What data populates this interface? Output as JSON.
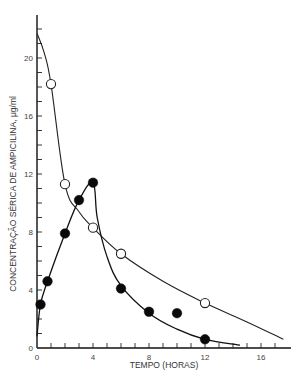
{
  "chart_data": {
    "type": "line",
    "title": "",
    "xlabel": "TEMPO (HORAS)",
    "ylabel": "CONCENTRAÇÃO SÉRICA DE AMPICILINA, μg/ml",
    "xlim": [
      0,
      18.5
    ],
    "ylim": [
      0,
      23
    ],
    "x_ticks": [
      0,
      4,
      8,
      12,
      16
    ],
    "y_ticks": [
      0,
      4,
      8,
      12,
      16,
      20
    ],
    "minor_tick_step": 1,
    "grid": false,
    "legend": null,
    "series": [
      {
        "name": "open-circles",
        "marker": "open-circle",
        "line_color": "#222222",
        "points": [
          {
            "x": 1,
            "y": 18.2
          },
          {
            "x": 2,
            "y": 11.3
          },
          {
            "x": 4,
            "y": 8.3
          },
          {
            "x": 6,
            "y": 6.5
          },
          {
            "x": 12,
            "y": 3.1
          }
        ],
        "fitted_curve": [
          {
            "x": 0,
            "y": 21.7
          },
          {
            "x": 0.5,
            "y": 20.4
          },
          {
            "x": 1,
            "y": 18.2
          },
          {
            "x": 2,
            "y": 11.3
          },
          {
            "x": 3,
            "y": 9.4
          },
          {
            "x": 4,
            "y": 8.3
          },
          {
            "x": 6,
            "y": 6.5
          },
          {
            "x": 9,
            "y": 4.6
          },
          {
            "x": 12,
            "y": 3.1
          },
          {
            "x": 15,
            "y": 1.8
          },
          {
            "x": 17.6,
            "y": 0.6
          }
        ]
      },
      {
        "name": "filled-circles",
        "marker": "filled-circle",
        "line_color": "#111111",
        "points": [
          {
            "x": 0.25,
            "y": 3.0
          },
          {
            "x": 0.75,
            "y": 4.6
          },
          {
            "x": 2,
            "y": 7.9
          },
          {
            "x": 3,
            "y": 10.2
          },
          {
            "x": 4,
            "y": 11.4
          },
          {
            "x": 6,
            "y": 4.1
          },
          {
            "x": 8,
            "y": 2.5
          },
          {
            "x": 10,
            "y": 2.4
          },
          {
            "x": 12,
            "y": 0.6
          }
        ],
        "fitted_curve": [
          {
            "x": 0,
            "y": 0.8
          },
          {
            "x": 0.25,
            "y": 3.0
          },
          {
            "x": 0.75,
            "y": 4.6
          },
          {
            "x": 2,
            "y": 7.9
          },
          {
            "x": 3,
            "y": 10.2
          },
          {
            "x": 4,
            "y": 11.4
          },
          {
            "x": 4.3,
            "y": 9.0
          },
          {
            "x": 5,
            "y": 6.3
          },
          {
            "x": 6,
            "y": 4.3
          },
          {
            "x": 8,
            "y": 2.4
          },
          {
            "x": 10,
            "y": 1.3
          },
          {
            "x": 12,
            "y": 0.6
          },
          {
            "x": 14.5,
            "y": 0.2
          }
        ]
      }
    ]
  }
}
